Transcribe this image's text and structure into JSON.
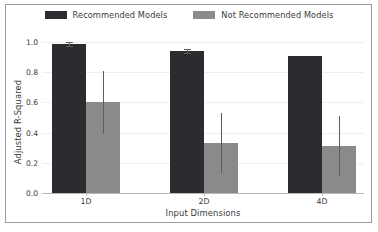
{
  "chart_data": {
    "type": "bar",
    "title": "",
    "xlabel": "Input Dimensions",
    "ylabel": "Adjusted R-Squared",
    "categories": [
      "1D",
      "2D",
      "4D"
    ],
    "ylim": [
      0.0,
      1.0
    ],
    "yticks": [
      0.0,
      0.2,
      0.4,
      0.6,
      0.8,
      1.0
    ],
    "ytick_labels": [
      "0.0",
      "0.2",
      "0.4",
      "0.6",
      "0.8",
      "1.0"
    ],
    "grid": true,
    "legend_position": "top-center",
    "series": [
      {
        "name": "Recommended Models",
        "color": "#2b2b30",
        "values": [
          0.99,
          0.94,
          0.91
        ],
        "err_low": [
          0.975,
          0.925,
          null
        ],
        "err_high": [
          1.0,
          0.955,
          null
        ]
      },
      {
        "name": "Not Recommended Models",
        "color": "#8a8a8a",
        "values": [
          0.6,
          0.33,
          0.31
        ],
        "err_low": [
          0.39,
          0.13,
          0.11
        ],
        "err_high": [
          0.81,
          0.53,
          0.51
        ]
      }
    ]
  },
  "legend": {
    "entries": [
      {
        "label": "Recommended Models",
        "color": "#2b2b30"
      },
      {
        "label": "Not Recommended Models",
        "color": "#8a8a8a"
      }
    ]
  },
  "axes": {
    "y_label": "Adjusted R-Squared",
    "x_label": "Input Dimensions",
    "y_tick_labels": [
      "1.0",
      "0.8",
      "0.6",
      "0.4",
      "0.2",
      "0.0"
    ],
    "x_tick_labels": [
      "1D",
      "2D",
      "4D"
    ]
  },
  "style": {
    "frame_color": "#9a9a9a",
    "grid_color": "#eeeeee",
    "axis_color": "#b9b9b9",
    "error_color": "#5c5c5c",
    "text_color": "#3a3a3a",
    "background": "#ffffff"
  }
}
